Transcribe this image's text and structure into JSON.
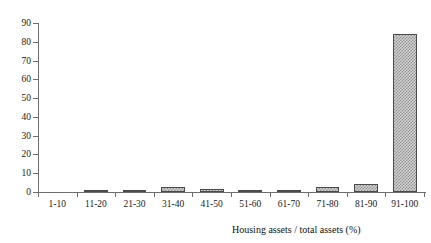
{
  "top_caption": "",
  "chart_data": {
    "type": "bar",
    "title": "",
    "subtitle": "",
    "xlabel": "Housing assets / total assets (%)",
    "ylabel": "",
    "categories": [
      "1-10",
      "11-20",
      "21-30",
      "31-40",
      "41-50",
      "51-60",
      "61-70",
      "71-80",
      "81-90",
      "91-100"
    ],
    "values": [
      0,
      0.6,
      1.1,
      2.8,
      1.7,
      0.9,
      1.2,
      2.7,
      4.1,
      84
    ],
    "ylim": [
      0,
      90
    ],
    "yticks": [
      0,
      10,
      20,
      30,
      40,
      50,
      60,
      70,
      80,
      90
    ],
    "ytick_labels": [
      "0",
      "10",
      "20",
      "30",
      "40",
      "50",
      "60",
      "70",
      "80",
      "90"
    ],
    "grid": false,
    "legend": null,
    "bar_fill": "#d2d2d2",
    "bar_pattern": "diagonal-crosshatch",
    "bar_edge_color": "#4a4a4a",
    "axis_color": "#6d6d6d",
    "background": "#ffffff"
  }
}
